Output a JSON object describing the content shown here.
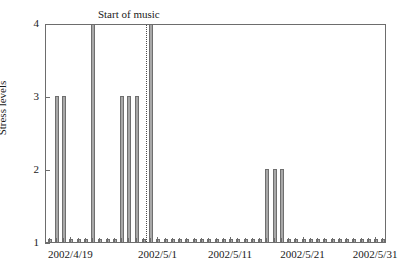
{
  "chart_data": {
    "type": "bar",
    "title": "",
    "xlabel": "",
    "ylabel": "Stress levels",
    "ylim": [
      1,
      4
    ],
    "yticks": [
      1,
      2,
      3,
      4
    ],
    "ytick_labels": [
      "1",
      "2",
      "3",
      "4"
    ],
    "xlim": [
      "2002/4/16",
      "2002/6/2"
    ],
    "xtick_labels": [
      "2002/4/19",
      "2002/5/1",
      "2002/5/11",
      "2002/5/21",
      "2002/5/31"
    ],
    "xtick_positions_days": [
      3,
      15,
      25,
      35,
      45
    ],
    "grid": false,
    "legend": null,
    "bar_color": "#a8a8a8",
    "bar_edge_color": "#6f6f6f",
    "annotations": [
      {
        "text": "Start of music",
        "type": "vertical-dotted-line",
        "line_color": "#4a4a4a",
        "x_day": 13
      }
    ],
    "x_days": [
      0,
      1,
      2,
      3,
      4,
      5,
      6,
      7,
      8,
      9,
      10,
      11,
      12,
      13,
      14,
      15,
      16,
      17,
      18,
      19,
      20,
      21,
      22,
      23,
      24,
      25,
      26,
      27,
      28,
      29,
      30,
      31,
      32,
      33,
      34,
      35,
      36,
      37,
      38,
      39,
      40,
      41,
      42,
      43,
      44,
      45,
      46
    ],
    "x_dates": [
      "2002/4/16",
      "2002/4/17",
      "2002/4/18",
      "2002/4/19",
      "2002/4/20",
      "2002/4/21",
      "2002/4/22",
      "2002/4/23",
      "2002/4/24",
      "2002/4/25",
      "2002/4/26",
      "2002/4/27",
      "2002/4/28",
      "2002/4/29",
      "2002/4/30",
      "2002/5/1",
      "2002/5/2",
      "2002/5/3",
      "2002/5/4",
      "2002/5/5",
      "2002/5/6",
      "2002/5/7",
      "2002/5/8",
      "2002/5/9",
      "2002/5/10",
      "2002/5/11",
      "2002/5/12",
      "2002/5/13",
      "2002/5/14",
      "2002/5/15",
      "2002/5/16",
      "2002/5/17",
      "2002/5/18",
      "2002/5/19",
      "2002/5/20",
      "2002/5/21",
      "2002/5/22",
      "2002/5/23",
      "2002/5/24",
      "2002/5/25",
      "2002/5/26",
      "2002/5/27",
      "2002/5/28",
      "2002/5/29",
      "2002/5/30",
      "2002/5/31",
      "2002/6/1"
    ],
    "values": [
      1,
      3,
      3,
      1,
      1,
      1,
      4,
      1,
      1,
      1,
      3,
      3,
      3,
      1,
      4,
      1,
      1,
      1,
      1,
      1,
      1,
      1,
      1,
      1,
      1,
      1,
      1,
      1,
      1,
      1,
      2,
      2,
      2,
      1,
      1,
      1,
      1,
      1,
      1,
      1,
      1,
      1,
      1,
      1,
      1,
      1,
      1
    ]
  }
}
